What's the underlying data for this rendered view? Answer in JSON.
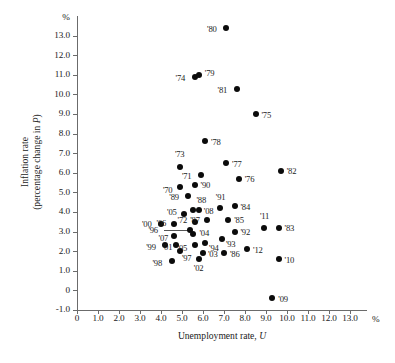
{
  "chart_data": {
    "type": "scatter",
    "title": "",
    "xlabel": "Unemployment rate, U",
    "ylabel_line1": "Inflation rate",
    "ylabel_line2": "(percentage change in P)",
    "x_unit": "%",
    "y_unit": "%",
    "xlim": [
      0,
      13.6
    ],
    "ylim": [
      -1.0,
      13.6
    ],
    "xticks": [
      "0",
      "1.0",
      "2.0",
      "3.0",
      "4.0",
      "5.0",
      "6.0",
      "7.0",
      "8.0",
      "9.0",
      "10.0",
      "11.0",
      "12.0",
      "13.0"
    ],
    "xtick_values": [
      0,
      1,
      2,
      3,
      4,
      5,
      6,
      7,
      8,
      9,
      10,
      11,
      12,
      13
    ],
    "yticks": [
      "13.0",
      "12.0",
      "11.0",
      "10.0",
      "9.0",
      "8.0",
      "7.0",
      "6.0",
      "5.0",
      "4.0",
      "3.0",
      "2.0",
      "1.0",
      "0",
      "-1.0"
    ],
    "ytick_values": [
      13,
      12,
      11,
      10,
      9,
      8,
      7,
      6,
      5,
      4,
      3,
      2,
      1,
      0,
      -1
    ],
    "grid": false,
    "legend": "none",
    "points": [
      {
        "label": "'70",
        "x": 4.9,
        "y": 5.3,
        "lx": -17,
        "ly": 4
      },
      {
        "label": "'71",
        "x": 5.9,
        "y": 5.9,
        "lx": -19,
        "ly": 2
      },
      {
        "label": "'72",
        "x": 5.6,
        "y": 3.5,
        "lx": -17,
        "ly": -1
      },
      {
        "label": "'73",
        "x": 4.9,
        "y": 6.3,
        "lx": -5,
        "ly": -12
      },
      {
        "label": "'74",
        "x": 5.6,
        "y": 10.9,
        "lx": -19,
        "ly": 2
      },
      {
        "label": "'75",
        "x": 8.5,
        "y": 9.0,
        "lx": 6,
        "ly": 1
      },
      {
        "label": "'76",
        "x": 7.7,
        "y": 5.7,
        "lx": 6,
        "ly": 1
      },
      {
        "label": "'77",
        "x": 7.1,
        "y": 6.5,
        "lx": 6,
        "ly": 1
      },
      {
        "label": "'78",
        "x": 6.1,
        "y": 7.6,
        "lx": 6,
        "ly": 1
      },
      {
        "label": "'79",
        "x": 5.8,
        "y": 11.0,
        "lx": 6,
        "ly": -1
      },
      {
        "label": "'80",
        "x": 7.1,
        "y": 13.4,
        "lx": -19,
        "ly": 2
      },
      {
        "label": "'81",
        "x": 7.6,
        "y": 10.3,
        "lx": -19,
        "ly": 2
      },
      {
        "label": "'82",
        "x": 9.7,
        "y": 6.1,
        "lx": 6,
        "ly": 1
      },
      {
        "label": "'83",
        "x": 9.6,
        "y": 3.2,
        "lx": 6,
        "ly": 1
      },
      {
        "label": "'84",
        "x": 7.5,
        "y": 4.3,
        "lx": 6,
        "ly": 1
      },
      {
        "label": "'85",
        "x": 7.2,
        "y": 3.6,
        "lx": 6,
        "ly": 1
      },
      {
        "label": "'86",
        "x": 7.0,
        "y": 1.9,
        "lx": 6,
        "ly": 1
      },
      {
        "label": "'87",
        "x": 6.2,
        "y": 3.6,
        "lx": -17,
        "ly": 1
      },
      {
        "label": "'88",
        "x": 5.5,
        "y": 4.1,
        "lx": 4,
        "ly": -10
      },
      {
        "label": "'89",
        "x": 5.3,
        "y": 4.8,
        "lx": -19,
        "ly": 1
      },
      {
        "label": "'90",
        "x": 5.6,
        "y": 5.4,
        "lx": 6,
        "ly": 1
      },
      {
        "label": "'91",
        "x": 6.8,
        "y": 4.2,
        "lx": -4,
        "ly": -11
      },
      {
        "label": "'92",
        "x": 7.5,
        "y": 3.0,
        "lx": 6,
        "ly": 1
      },
      {
        "label": "'93",
        "x": 6.9,
        "y": 2.6,
        "lx": 4,
        "ly": 5
      },
      {
        "label": "'94",
        "x": 6.1,
        "y": 2.4,
        "lx": 4,
        "ly": 5
      },
      {
        "label": "'95",
        "x": 5.6,
        "y": 2.3,
        "lx": -17,
        "ly": 3
      },
      {
        "label": "'96",
        "x": 5.4,
        "y": 3.1,
        "lx": -42,
        "ly": 1,
        "leader": true
      },
      {
        "label": "'97",
        "x": 4.9,
        "y": 2.0,
        "lx": 2,
        "ly": 7
      },
      {
        "label": "'98",
        "x": 4.5,
        "y": 1.5,
        "lx": -19,
        "ly": 2
      },
      {
        "label": "'99",
        "x": 4.2,
        "y": 2.3,
        "lx": -19,
        "ly": 2
      },
      {
        "label": "'00",
        "x": 4.0,
        "y": 3.4,
        "lx": -19,
        "ly": 1
      },
      {
        "label": "'01",
        "x": 4.7,
        "y": 2.3,
        "lx": -13,
        "ly": 2
      },
      {
        "label": "'02",
        "x": 5.8,
        "y": 1.6,
        "lx": -5,
        "ly": 9
      },
      {
        "label": "'03",
        "x": 6.0,
        "y": 1.9,
        "lx": 5,
        "ly": 1
      },
      {
        "label": "'04",
        "x": 5.5,
        "y": 2.9,
        "lx": 7,
        "ly": 0
      },
      {
        "label": "'05",
        "x": 5.1,
        "y": 3.9,
        "lx": -17,
        "ly": -1
      },
      {
        "label": "'06",
        "x": 4.6,
        "y": 3.4,
        "lx": -17,
        "ly": 0
      },
      {
        "label": "'07",
        "x": 4.6,
        "y": 2.8,
        "lx": -15,
        "ly": 3
      },
      {
        "label": "'08",
        "x": 5.8,
        "y": 4.1,
        "lx": 5,
        "ly": 1
      },
      {
        "label": "'09",
        "x": 9.3,
        "y": -0.4,
        "lx": 6,
        "ly": 1
      },
      {
        "label": "'10",
        "x": 9.6,
        "y": 1.6,
        "lx": 6,
        "ly": 1
      },
      {
        "label": "'11",
        "x": 8.9,
        "y": 3.2,
        "lx": -4,
        "ly": -11
      },
      {
        "label": "'12",
        "x": 8.1,
        "y": 2.1,
        "lx": 6,
        "ly": 1
      }
    ]
  }
}
